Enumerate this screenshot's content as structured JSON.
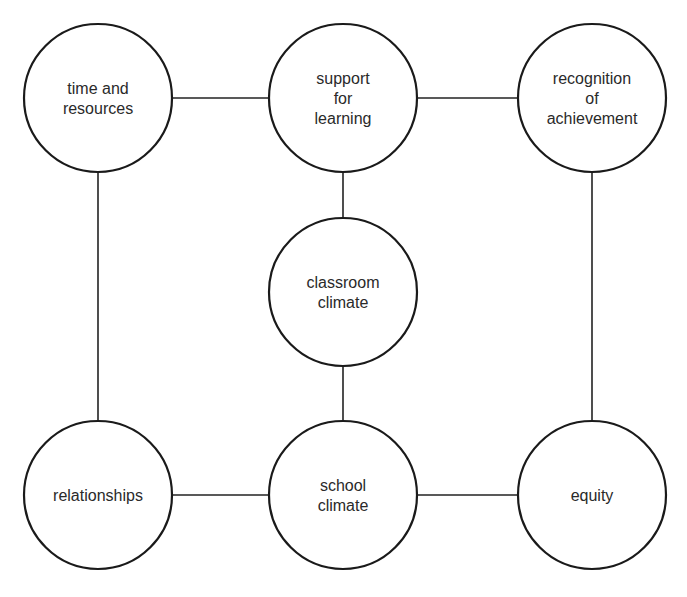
{
  "diagram": {
    "title": "",
    "nodes": [
      {
        "id": "time",
        "name": "node-time-and-resources",
        "lines": [
          "time and",
          "resources"
        ],
        "row": 0,
        "col": 0
      },
      {
        "id": "support",
        "name": "node-support-for-learning",
        "lines": [
          "support",
          "for",
          "learning"
        ],
        "row": 0,
        "col": 1
      },
      {
        "id": "recognition",
        "name": "node-recognition-of-achievement",
        "lines": [
          "recognition",
          "of",
          "achievement"
        ],
        "row": 0,
        "col": 2
      },
      {
        "id": "classroom",
        "name": "node-classroom-climate",
        "lines": [
          "classroom",
          "climate"
        ],
        "row": 1,
        "col": 1
      },
      {
        "id": "relationships",
        "name": "node-relationships",
        "lines": [
          "relationships"
        ],
        "row": 2,
        "col": 0
      },
      {
        "id": "school",
        "name": "node-school-climate",
        "lines": [
          "school",
          "climate"
        ],
        "row": 2,
        "col": 1
      },
      {
        "id": "equity",
        "name": "node-equity",
        "lines": [
          "equity"
        ],
        "row": 2,
        "col": 2
      }
    ],
    "edges": [
      [
        "time",
        "support"
      ],
      [
        "support",
        "recognition"
      ],
      [
        "support",
        "classroom"
      ],
      [
        "classroom",
        "school"
      ],
      [
        "time",
        "relationships"
      ],
      [
        "recognition",
        "equity"
      ],
      [
        "relationships",
        "school"
      ],
      [
        "school",
        "equity"
      ]
    ]
  }
}
